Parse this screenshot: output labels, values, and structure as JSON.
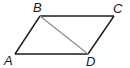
{
  "figure": {
    "shape": "parallelogram",
    "vertices": {
      "A": "A",
      "B": "B",
      "C": "C",
      "D": "D"
    },
    "sides": [
      "AB",
      "BC",
      "CD",
      "DA"
    ],
    "diagonal": "BD",
    "colors": {
      "outline": "#1a1a1a",
      "diagonal": "#8a8a8a"
    }
  }
}
